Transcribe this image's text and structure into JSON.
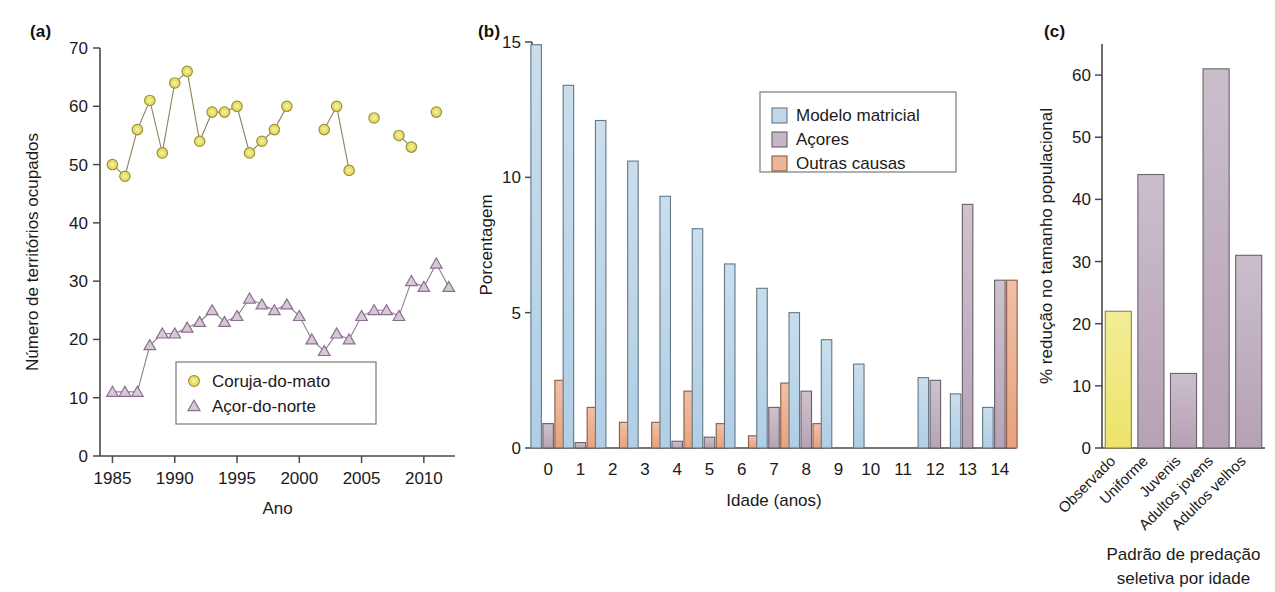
{
  "figure": {
    "panel_a_label": "(a)",
    "panel_b_label": "(b)",
    "panel_c_label": "(c)"
  },
  "chart_data": [
    {
      "panel": "(a)",
      "type": "line",
      "title": "",
      "xlabel": "Ano",
      "ylabel": "Número de territórios ocupados",
      "xlim": [
        1984,
        2012.5
      ],
      "ylim": [
        0,
        70
      ],
      "xticks": [
        1985,
        1990,
        1995,
        2000,
        2005,
        2010
      ],
      "yticks": [
        0,
        10,
        20,
        30,
        40,
        50,
        60,
        70
      ],
      "grid": false,
      "legend_position": "bottom-center",
      "series": [
        {
          "name": "Coruja-do-mato",
          "marker": "circle",
          "color": "#e8e06a",
          "x": [
            1985,
            1986,
            1987,
            1988,
            1989,
            1990,
            1991,
            1992,
            1993,
            1994,
            1995,
            1996,
            1997,
            1998,
            1999,
            2000,
            2002,
            2003,
            2004,
            2006,
            2008,
            2009,
            2011
          ],
          "values": [
            50,
            48,
            56,
            61,
            52,
            64,
            66,
            54,
            59,
            59,
            60,
            52,
            54,
            56,
            60,
            null,
            56,
            60,
            49,
            58,
            55,
            53,
            59
          ]
        },
        {
          "name": "Açor-do-norte",
          "marker": "triangle",
          "color": "#d8c7d8",
          "x": [
            1985,
            1986,
            1987,
            1988,
            1989,
            1990,
            1991,
            1992,
            1993,
            1994,
            1995,
            1996,
            1997,
            1998,
            1999,
            2000,
            2001,
            2002,
            2003,
            2004,
            2005,
            2006,
            2007,
            2008,
            2009,
            2010,
            2011,
            2012
          ],
          "values": [
            11,
            11,
            11,
            19,
            21,
            21,
            22,
            23,
            25,
            23,
            24,
            27,
            26,
            25,
            26,
            24,
            20,
            18,
            21,
            20,
            24,
            25,
            25,
            24,
            30,
            29,
            33,
            29
          ]
        }
      ]
    },
    {
      "panel": "(b)",
      "type": "bar",
      "title": "",
      "xlabel": "Idade (anos)",
      "ylabel": "Porcentagem",
      "ylim": [
        0,
        15
      ],
      "yticks": [
        0,
        5,
        10,
        15
      ],
      "grid": false,
      "legend_position": "top-right",
      "categories": [
        "0",
        "1",
        "2",
        "3",
        "4",
        "5",
        "6",
        "7",
        "8",
        "9",
        "10",
        "11",
        "12",
        "13",
        "14"
      ],
      "series": [
        {
          "name": "Modelo matricial",
          "color": "#aecde4",
          "values": [
            14.9,
            13.4,
            12.1,
            10.6,
            9.3,
            8.1,
            6.8,
            5.9,
            5.0,
            4.0,
            3.1,
            0.0,
            2.6,
            2.0,
            1.5
          ]
        },
        {
          "name": "Açores",
          "color": "#b5a2b4",
          "values": [
            0.9,
            0.2,
            0.0,
            0.0,
            0.25,
            0.4,
            0.0,
            1.5,
            2.1,
            0.0,
            0.0,
            0.0,
            2.5,
            9.0,
            6.2
          ]
        },
        {
          "name": "Outras causas",
          "color": "#e8a07a",
          "values": [
            2.5,
            1.5,
            0.95,
            0.95,
            2.1,
            0.9,
            0.45,
            2.4,
            0.9,
            0.0,
            0.0,
            0.0,
            0.0,
            0.0,
            6.2
          ]
        }
      ]
    },
    {
      "panel": "(c)",
      "type": "bar",
      "title": "",
      "xlabel": "Padrão de predação\nseletiva por idade",
      "xlabel_line1": "Padrão de predação",
      "xlabel_line2": "seletiva por idade",
      "ylabel": "% redução no tamanho populacional",
      "ylim": [
        0,
        65
      ],
      "yticks": [
        0,
        10,
        20,
        30,
        40,
        50,
        60
      ],
      "grid": false,
      "categories": [
        "Observado",
        "Uniforme",
        "Juvenis",
        "Adultos jovens",
        "Adultos velhos"
      ],
      "values": [
        22,
        44,
        12,
        61,
        31
      ],
      "colors": [
        "#ece46a",
        "#b5a2b4",
        "#b5a2b4",
        "#b5a2b4",
        "#b5a2b4"
      ]
    }
  ]
}
